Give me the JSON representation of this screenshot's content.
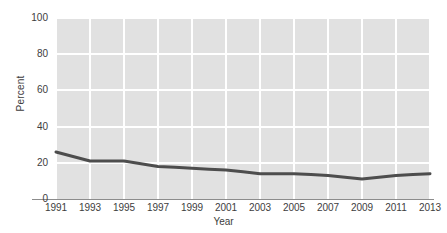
{
  "chart_data": {
    "type": "line",
    "title": "",
    "xlabel": "Year",
    "ylabel": "Percent",
    "xlim": [
      1991,
      2013
    ],
    "ylim": [
      0,
      100
    ],
    "grid": true,
    "legend": false,
    "line_color": "#4d4d4d",
    "panel_color": "#e1e1e1",
    "grid_color": "#ffffff",
    "ytick_labels": [
      "100",
      "80",
      "60",
      "40",
      "20",
      "0"
    ],
    "ytick_values": [
      100,
      80,
      60,
      40,
      20,
      0
    ],
    "xtick_labels": [
      "1991",
      "1993",
      "1995",
      "1997",
      "1999",
      "2001",
      "2003",
      "2005",
      "2007",
      "2009",
      "2011",
      "2013"
    ],
    "xtick_values": [
      1991,
      1993,
      1995,
      1997,
      1999,
      2001,
      2003,
      2005,
      2007,
      2009,
      2011,
      2013
    ],
    "x": [
      1991,
      1992,
      1993,
      1994,
      1995,
      1996,
      1997,
      1998,
      1999,
      2000,
      2001,
      2002,
      2003,
      2004,
      2005,
      2006,
      2007,
      2008,
      2009,
      2010,
      2011,
      2012,
      2013
    ],
    "values": [
      26,
      23.5,
      21,
      21,
      21,
      19.5,
      18,
      17.5,
      17,
      16.5,
      16,
      15,
      14,
      14,
      14,
      13.5,
      13,
      12,
      11,
      12,
      13,
      13.5,
      14
    ],
    "series": [
      {
        "name": "Percent",
        "values": [
          26,
          23.5,
          21,
          21,
          21,
          19.5,
          18,
          17.5,
          17,
          16.5,
          16,
          15,
          14,
          14,
          14,
          13.5,
          13,
          12,
          11,
          12,
          13,
          13.5,
          14
        ]
      }
    ]
  }
}
